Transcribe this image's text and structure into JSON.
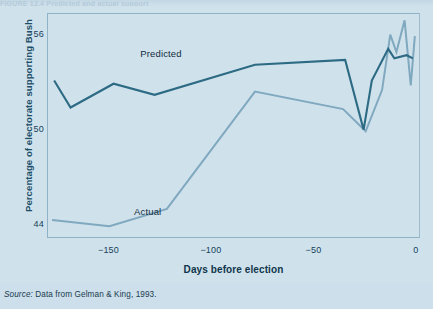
{
  "figure": {
    "top_caption_fragment": "FIGURE 12.4  Predicted and actual support",
    "source_prefix": "Source:",
    "source_text": " Data from Gelman & King, 1993."
  },
  "colors": {
    "background": "#cfe2ec",
    "frame": "#8fb2c6",
    "predicted": "#2d6a83",
    "actual": "#80a8bf",
    "axis_label": "#10354a",
    "ylabel": "#1d4e68"
  },
  "chart_data": {
    "type": "line",
    "title": "",
    "xlabel": "Days before election",
    "ylabel": "Percentage of electorate supporting Bush",
    "xlim": [
      -180,
      2
    ],
    "ylim": [
      43.2,
      57.4
    ],
    "xticks": [
      -150,
      -100,
      -50,
      0
    ],
    "xticklabels": [
      "−150",
      "−100",
      "−50",
      "0"
    ],
    "yticks": [
      44,
      50,
      56
    ],
    "yticklabels": [
      "44",
      "50",
      "56"
    ],
    "yminorticks": [
      46,
      48,
      52,
      54
    ],
    "grid": false,
    "legend": "inline-annotations",
    "annotations": [
      {
        "text": "Predicted",
        "x": -135,
        "y": 54.9
      },
      {
        "text": "Actual",
        "x": -138,
        "y": 44.9
      }
    ],
    "series": [
      {
        "name": "Predicted",
        "color": "#2d6a83",
        "points": [
          [
            -177,
            53.2
          ],
          [
            -169,
            51.5
          ],
          [
            -148,
            53.0
          ],
          [
            -128,
            52.3
          ],
          [
            -79,
            54.2
          ],
          [
            -35,
            54.5
          ],
          [
            -26,
            50.1
          ],
          [
            -22,
            53.2
          ],
          [
            -14,
            55.2
          ],
          [
            -11,
            54.6
          ],
          [
            -5,
            54.8
          ],
          [
            -2,
            54.6
          ]
        ]
      },
      {
        "name": "Actual",
        "color": "#80a8bf",
        "points": [
          [
            -178,
            44.4
          ],
          [
            -150,
            44.0
          ],
          [
            -122,
            45.1
          ],
          [
            -79,
            52.5
          ],
          [
            -36,
            51.4
          ],
          [
            -25,
            50.0
          ],
          [
            -17,
            52.6
          ],
          [
            -13,
            56.1
          ],
          [
            -10,
            55.0
          ],
          [
            -6,
            57.0
          ],
          [
            -3,
            52.9
          ],
          [
            -1,
            56.0
          ]
        ]
      }
    ]
  }
}
